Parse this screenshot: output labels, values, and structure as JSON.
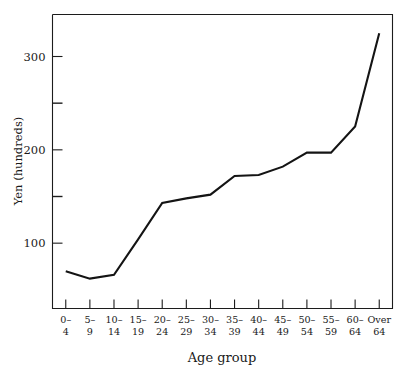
{
  "chart_data": {
    "type": "line",
    "title": "",
    "xlabel": "Age group",
    "ylabel": "Yen (hundreds)",
    "categories": [
      "0–\n4",
      "5–\n9",
      "10–\n14",
      "15–\n19",
      "20–\n24",
      "25–\n29",
      "30–\n34",
      "35–\n39",
      "40–\n44",
      "45–\n49",
      "50–\n54",
      "55–\n59",
      "60–\n64",
      "Over\n64"
    ],
    "category_lines": [
      [
        "0–",
        "4"
      ],
      [
        "5–",
        "9"
      ],
      [
        "10–",
        "14"
      ],
      [
        "15–",
        "19"
      ],
      [
        "20–",
        "24"
      ],
      [
        "25–",
        "29"
      ],
      [
        "30–",
        "34"
      ],
      [
        "35–",
        "39"
      ],
      [
        "40–",
        "44"
      ],
      [
        "45–",
        "49"
      ],
      [
        "50–",
        "54"
      ],
      [
        "55–",
        "59"
      ],
      [
        "60–",
        "64"
      ],
      [
        "Over",
        "64"
      ]
    ],
    "values": [
      70,
      62,
      66,
      104,
      143,
      148,
      152,
      172,
      173,
      182,
      197,
      197,
      225,
      325
    ],
    "ylim": [
      30,
      345
    ],
    "xlim": [
      -0.55,
      13.55
    ],
    "ytick_values": [
      100,
      200,
      300
    ],
    "ytick_labels": [
      "100",
      "200",
      "300"
    ],
    "yminor_tick_values": [
      150,
      250
    ],
    "grid": false,
    "legend": false,
    "legend_position": "none",
    "line_color": "#141414",
    "axis_color": "#1c1c1c",
    "background_color": "#ffffff"
  },
  "axes": {
    "y_axis_title": "Yen (hundreds)",
    "x_axis_title": "Age group"
  }
}
